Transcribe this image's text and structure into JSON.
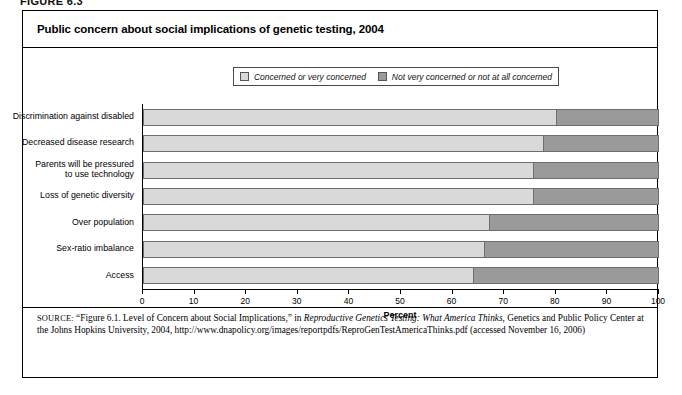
{
  "figure": {
    "label": "FIGURE 6.3",
    "title": "Public concern about social implications of genetic testing, 2004"
  },
  "legend": {
    "items": [
      {
        "label": "Concerned or very concerned",
        "color": "#d9d9d9",
        "swatch": "light"
      },
      {
        "label": "Not very concerned or not at all concerned",
        "color": "#9a9a9a",
        "swatch": "dark"
      }
    ]
  },
  "axis": {
    "x_title": "Percent",
    "ticks": [
      "0",
      "10",
      "20",
      "30",
      "40",
      "50",
      "60",
      "70",
      "80",
      "90",
      "100"
    ]
  },
  "source": {
    "keyword": "SOURCE:",
    "part1": " “Figure 6.1. Level of Concern about Social Implications,” in ",
    "italic1": "Reproductive Genetics Testing: What America Thinks,",
    "part2": " Genetics and Public Policy Center at the Johns Hopkins University, 2004, http://www.dnapolicy.org/images/reportpdfs/ReproGenTestAmericaThinks.pdf (accessed November 16, 2006)"
  },
  "chart_data": {
    "type": "bar",
    "orientation": "horizontal",
    "stacked": true,
    "percent_total": 100,
    "title": "Public concern about social implications of genetic testing, 2004",
    "xlabel": "Percent",
    "ylabel": "",
    "xlim": [
      0,
      100
    ],
    "xticks": [
      0,
      10,
      20,
      30,
      40,
      50,
      60,
      70,
      80,
      90,
      100
    ],
    "grid": false,
    "legend_position": "top",
    "categories": [
      "Discrimination against disabled",
      "Decreased disease research",
      "Parents will be pressured\nto use technology",
      "Loss of genetic diversity",
      "Over population",
      "Sex-ratio imbalance",
      "Access"
    ],
    "series": [
      {
        "name": "Concerned or very concerned",
        "color": "#d9d9d9",
        "values": [
          80,
          77.5,
          75.5,
          75.5,
          67,
          66,
          64
        ]
      },
      {
        "name": "Not very concerned or not at all concerned",
        "color": "#9a9a9a",
        "values": [
          20,
          22.5,
          24.5,
          24.5,
          33,
          34,
          36
        ]
      }
    ]
  }
}
